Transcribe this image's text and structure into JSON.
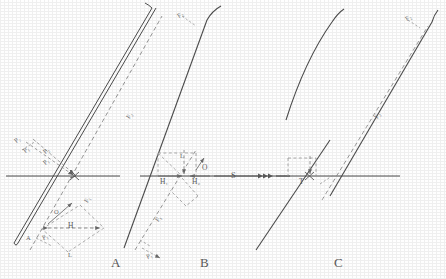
{
  "figure": {
    "type": "optical-ray-construction-diagram",
    "panel_count": 3,
    "ink_color": "#4d4d4d",
    "dash_color": "#8a8a8a",
    "background": "#fefefe"
  },
  "panels": [
    {
      "id": "A",
      "letter": "A",
      "labels": {
        "p2_upper_left": "P₂",
        "p1_upper_left": "P₁",
        "p2_ray": "P₂",
        "f2_ray": "F₂",
        "f1_lower": "F₁",
        "o_point": "O",
        "h_span": "H",
        "p1_lower": "P₁",
        "l_lower": "L",
        "a_corner": "A"
      }
    },
    {
      "id": "B",
      "letter": "B",
      "labels": {
        "f2_top": "F₂",
        "h1": "H₁",
        "h2": "H₂",
        "s_axis": "S",
        "o_point": "O",
        "l_upper": "L",
        "f1_lower": "F₁",
        "p1_lower": "P₁"
      }
    },
    {
      "id": "C",
      "letter": "C",
      "labels": {
        "f2_top": "F₂",
        "t_point": "T",
        "f2_ray": "F₂"
      }
    }
  ],
  "axis": {
    "name": "optical-axis",
    "count": 3
  }
}
